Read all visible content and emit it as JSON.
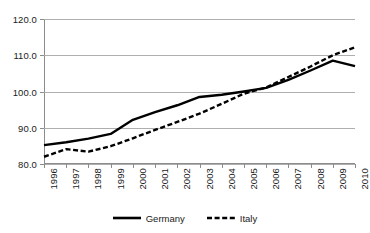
{
  "chart_data": {
    "type": "line",
    "title": "",
    "xlabel": "",
    "ylabel": "",
    "x": [
      1996,
      1997,
      1998,
      1999,
      2000,
      2001,
      2002,
      2003,
      2004,
      2005,
      2006,
      2007,
      2008,
      2009,
      2010
    ],
    "categories": [
      "1996",
      "1997",
      "1998",
      "1999",
      "2000",
      "2001",
      "2002",
      "2003",
      "2004",
      "2005",
      "2006",
      "2007",
      "2008",
      "2009",
      "2010"
    ],
    "series": [
      {
        "name": "Germany",
        "style": "solid",
        "color": "#000000",
        "values": [
          85.2,
          86.0,
          87.0,
          88.3,
          92.2,
          94.3,
          96.2,
          98.5,
          99.1,
          100.0,
          101.0,
          103.2,
          105.8,
          108.5,
          107.0
        ]
      },
      {
        "name": "Italy",
        "style": "dashed",
        "color": "#000000",
        "values": [
          82.0,
          84.1,
          83.4,
          84.9,
          87.1,
          89.4,
          91.6,
          93.9,
          96.6,
          99.4,
          101.1,
          104.0,
          106.9,
          110.0,
          112.2
        ]
      }
    ],
    "ylim": [
      80.0,
      120.0
    ],
    "yticks": [
      "80.0",
      "90.0",
      "100.0",
      "110.0",
      "120.0"
    ],
    "ytick_values": [
      80.0,
      90.0,
      100.0,
      110.0,
      120.0
    ],
    "grid": true,
    "legend_position": "bottom",
    "gridline_color": "#aeaeae",
    "axis_color": "#8c8c8c"
  },
  "legend": {
    "items": [
      {
        "label": "Germany"
      },
      {
        "label": "Italy"
      }
    ]
  }
}
